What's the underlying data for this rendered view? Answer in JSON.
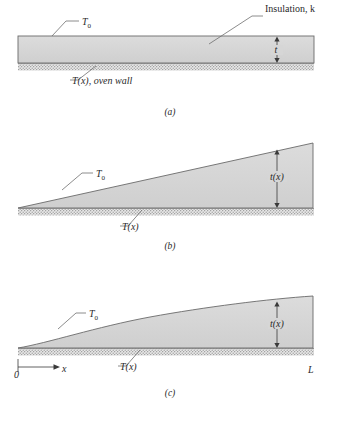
{
  "figure": {
    "domain": "heat-transfer-insulation-diagram",
    "background_color": "#ffffff",
    "fill_color": "#d4d4d4",
    "outline_color": "#6a6a6a",
    "wall_color": "#c0c0c0",
    "leader_color": "#6f6f6f"
  },
  "panels": [
    {
      "id": "a",
      "caption": "(a)",
      "shape": "uniform-thickness-slab",
      "labels": {
        "surface_temperature": "T",
        "surface_temperature_sub": "0",
        "material": "Insulation, k",
        "thickness": "t",
        "wall": "T(x), oven wall"
      }
    },
    {
      "id": "b",
      "caption": "(b)",
      "shape": "linear-wedge",
      "labels": {
        "surface_temperature": "T",
        "surface_temperature_sub": "0",
        "thickness": "t(x)",
        "wall": "T(x)"
      }
    },
    {
      "id": "c",
      "caption": "(c)",
      "shape": "curved-profile",
      "labels": {
        "surface_temperature": "T",
        "surface_temperature_sub": "0",
        "thickness": "t(x)",
        "wall": "T(x)",
        "origin": "0",
        "axis": "x",
        "length": "L"
      }
    }
  ]
}
